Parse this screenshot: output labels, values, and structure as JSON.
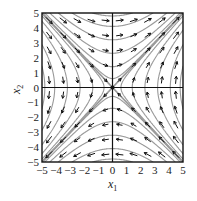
{
  "diagram": {
    "type": "phase_portrait",
    "system": {
      "dx1": "x2",
      "dx2": "x1"
    },
    "equilibrium": {
      "x1": 0,
      "x2": 0,
      "kind": "saddle"
    },
    "xlabel": "x",
    "xlabel_sub": "1",
    "ylabel": "x",
    "ylabel_sub": "2",
    "xlim": [
      -5,
      5
    ],
    "ylim": [
      -5,
      5
    ],
    "x_ticks": [
      "-5",
      "-4",
      "-3",
      "-2",
      "-1",
      "0",
      "1",
      "2",
      "3",
      "4",
      "5"
    ],
    "y_ticks": [
      "5",
      "4",
      "3",
      "2",
      "1",
      "0",
      "-1",
      "-2",
      "-3",
      "-4",
      "-5"
    ],
    "colors": {
      "frame": "#111111",
      "streamline": "#9a9a9a",
      "arrow": "#111111",
      "background": "#ffffff"
    }
  }
}
